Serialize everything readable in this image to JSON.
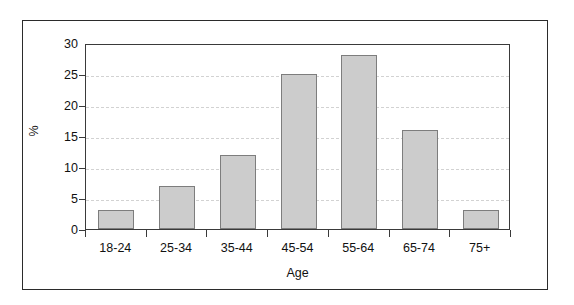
{
  "chart_data": {
    "type": "bar",
    "title": "",
    "subtitle": "",
    "xlabel": "Age",
    "ylabel": "%",
    "categories": [
      "18-24",
      "25-34",
      "35-44",
      "45-54",
      "55-64",
      "65-74",
      "75+"
    ],
    "values": [
      3,
      7,
      12,
      25,
      28,
      16,
      3
    ],
    "series": [
      {
        "name": "%",
        "values": [
          3,
          7,
          12,
          25,
          28,
          16,
          3
        ]
      }
    ],
    "ylim": [
      0,
      30
    ],
    "yticks": [
      0,
      5,
      10,
      15,
      20,
      25,
      30
    ],
    "ytick_labels": [
      "0",
      "5",
      "10",
      "15",
      "20",
      "25",
      "30"
    ],
    "grid": true,
    "grid_axis": "y",
    "grid_style": "dashed",
    "legend": false,
    "legend_position": "none",
    "annotations": [],
    "colors": {
      "bar_fill": "#cccccc",
      "bar_edge": "#7d7d7d",
      "axis": "#3a3a3a",
      "grid": "#d2d2d2",
      "frame": "#2b2b2b",
      "text": "#111111",
      "background": "#ffffff"
    }
  }
}
